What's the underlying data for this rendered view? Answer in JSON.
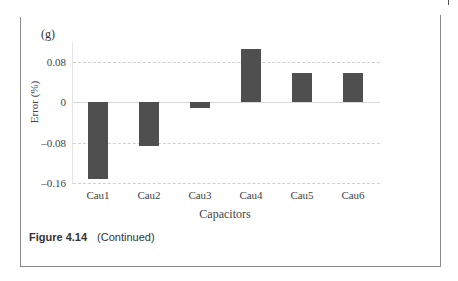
{
  "panel_label": "(g)",
  "caption": {
    "number": "Figure 4.14",
    "text": "(Continued)"
  },
  "chart_data": {
    "type": "bar",
    "title": "",
    "xlabel": "Capacitors",
    "ylabel": "Error (%)",
    "categories": [
      "Cau1",
      "Cau2",
      "Cau3",
      "Cau4",
      "Cau5",
      "Cau6"
    ],
    "values": [
      -0.152,
      -0.087,
      -0.012,
      0.105,
      0.058,
      0.058
    ],
    "yticks": [
      "0.08",
      "0",
      "–0.08",
      "–0.16"
    ],
    "ylim": [
      -0.16,
      0.12
    ],
    "grid": true,
    "legend": null,
    "bar_color": "#4f4f4f"
  }
}
